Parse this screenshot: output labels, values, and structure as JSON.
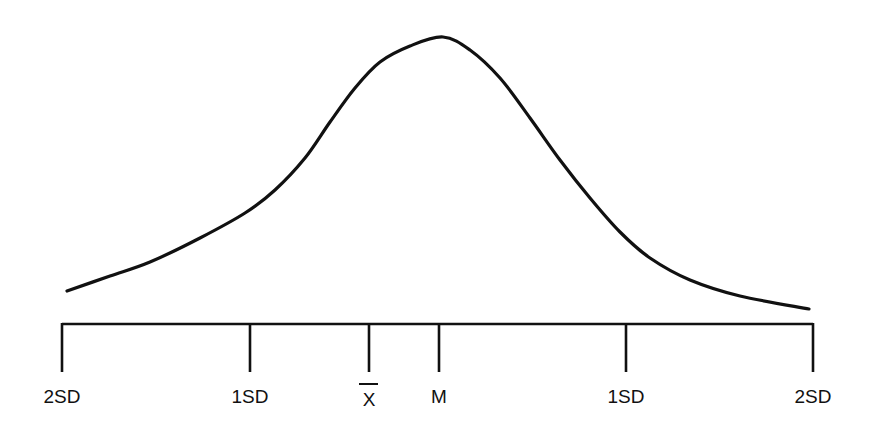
{
  "diagram": {
    "type": "skewed distribution curve",
    "colors": {
      "stroke": "#111111",
      "background": "#ffffff"
    },
    "curve": {
      "points": [
        [
          67,
          291
        ],
        [
          110,
          276
        ],
        [
          150,
          262
        ],
        [
          200,
          238
        ],
        [
          245,
          213
        ],
        [
          275,
          190
        ],
        [
          305,
          158
        ],
        [
          330,
          122
        ],
        [
          355,
          88
        ],
        [
          380,
          62
        ],
        [
          410,
          46
        ],
        [
          443,
          37
        ],
        [
          470,
          50
        ],
        [
          500,
          78
        ],
        [
          530,
          118
        ],
        [
          560,
          160
        ],
        [
          590,
          198
        ],
        [
          620,
          232
        ],
        [
          650,
          258
        ],
        [
          690,
          280
        ],
        [
          740,
          296
        ],
        [
          809,
          309
        ]
      ]
    },
    "axis": {
      "y": 324,
      "x_start": 62,
      "x_end": 813,
      "tick_bottom": 372
    },
    "ticks": [
      {
        "name": "left-2sd",
        "x": 62,
        "label": "2SD"
      },
      {
        "name": "left-1sd",
        "x": 250,
        "label": "1SD"
      },
      {
        "name": "mean",
        "x": 369,
        "label": "X",
        "overbar": true
      },
      {
        "name": "median",
        "x": 439,
        "label": "M"
      },
      {
        "name": "right-1sd",
        "x": 626,
        "label": "1SD"
      },
      {
        "name": "right-2sd",
        "x": 813,
        "label": "2SD"
      }
    ],
    "labels": {
      "left_2sd": "2SD",
      "left_1sd": "1SD",
      "mean": "X",
      "median": "M",
      "right_1sd": "1SD",
      "right_2sd": "2SD"
    }
  }
}
